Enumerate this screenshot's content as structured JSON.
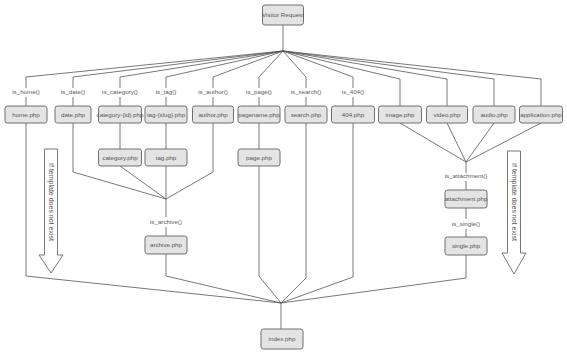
{
  "diagram": {
    "root": "Visitor Request",
    "final": "index.php",
    "branches": [
      {
        "condition": "is_home()",
        "templates": [
          "home.php"
        ]
      },
      {
        "condition": "is_date()",
        "templates": [
          "date.php"
        ]
      },
      {
        "condition": "is_category()",
        "templates": [
          "category-{id}.php",
          "category.php"
        ]
      },
      {
        "condition": "is_tag()",
        "templates": [
          "tag-{slug}.php",
          "tag.php"
        ]
      },
      {
        "condition": "is_author()",
        "templates": [
          "author.php"
        ]
      },
      {
        "condition": "is_page()",
        "templates": [
          "pagename.php",
          "page.php"
        ]
      },
      {
        "condition": "is_search()",
        "templates": [
          "search.php"
        ]
      },
      {
        "condition": "is_404()",
        "templates": [
          "404.php"
        ]
      },
      {
        "condition": "",
        "templates": [
          "image.php"
        ]
      },
      {
        "condition": "",
        "templates": [
          "video.php"
        ]
      },
      {
        "condition": "",
        "templates": [
          "audio.php"
        ]
      },
      {
        "condition": "",
        "templates": [
          "application.php"
        ]
      }
    ],
    "archive": {
      "condition": "is_archive()",
      "template": "archive.php"
    },
    "attachment": {
      "condition": "is_attachment()",
      "template": "attachment.php"
    },
    "single": {
      "condition": "is_single()",
      "template": "single.php"
    },
    "fallback_note": "If template does not exist",
    "colors": {
      "box_fill": "#e4e4e4",
      "box_stroke": "#6e6e6e",
      "line": "#555555",
      "text": "#555555"
    }
  }
}
